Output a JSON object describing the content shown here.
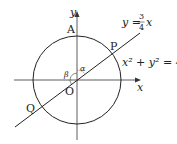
{
  "diagram": {
    "axes": {
      "x_label": "x",
      "y_label": "y"
    },
    "points": {
      "origin": "O",
      "A": "A",
      "P": "P",
      "Q": "Q"
    },
    "angles": {
      "alpha": "α",
      "beta": "β"
    },
    "line": {
      "equation_lhs": "y =",
      "numerator": "3",
      "denominator": "4",
      "variable": "x"
    },
    "circle": {
      "equation": "x² + y² = 4"
    },
    "colors": {
      "stroke": "#222222",
      "background": "#ffffff"
    }
  }
}
